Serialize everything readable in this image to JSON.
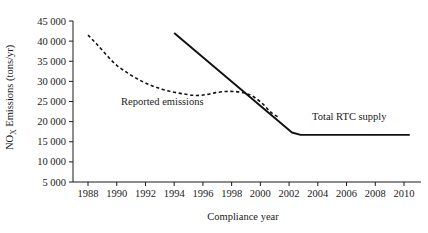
{
  "chart_data": {
    "type": "line",
    "title": "",
    "xlabel": "Compliance year",
    "ylabel": "NOₓ Emissions (tons/yr)",
    "ylabel_main": "NO",
    "ylabel_sub": "X",
    "ylabel_rest": " Emissions (tons/yr)",
    "xlim": [
      1988,
      2010
    ],
    "ylim": [
      5000,
      45000
    ],
    "grid": false,
    "legend_position": "inline-annotations",
    "xticks": [
      1988,
      1990,
      1992,
      1994,
      1996,
      1998,
      2000,
      2002,
      2004,
      2006,
      2008,
      2010
    ],
    "xtick_labels": [
      "1988",
      "1990",
      "1992",
      "1994",
      "1996",
      "1998",
      "2000",
      "2002",
      "2004",
      "2006",
      "2008",
      "2010"
    ],
    "yticks": [
      5000,
      10000,
      15000,
      20000,
      25000,
      30000,
      35000,
      40000,
      45000
    ],
    "ytick_labels": [
      "5 000",
      "10 000",
      "15 000",
      "20 000",
      "25 000",
      "30 000",
      "35 000",
      "40 000",
      "45 000"
    ],
    "series": [
      {
        "name": "Reported emissions",
        "style": "dashed",
        "color": "#111111",
        "label_x": 1990.3,
        "label_y": 24200,
        "x": [
          1988.0,
          1988.6,
          1989.3,
          1990.0,
          1990.8,
          1991.6,
          1992.4,
          1993.2,
          1994.0,
          1994.8,
          1995.5,
          1996.2,
          1996.9,
          1997.6,
          1998.3,
          1999.0,
          1999.6,
          2000.2,
          2000.7,
          2001.2
        ],
        "values": [
          41500,
          39300,
          36500,
          34000,
          32000,
          30300,
          29000,
          28000,
          27300,
          26800,
          26500,
          26700,
          27200,
          27500,
          27450,
          27000,
          26000,
          24300,
          22400,
          21200
        ]
      },
      {
        "name": "Total RTC supply",
        "style": "solid",
        "color": "#111111",
        "label_x": 2003.6,
        "label_y": 20300,
        "x": [
          1994.0,
          2002.2,
          2002.8,
          2010.4
        ],
        "values": [
          42000,
          17300,
          16700,
          16700
        ]
      }
    ],
    "annotations": [
      {
        "text": "Reported emissions",
        "x": 1990.3,
        "y": 24200
      },
      {
        "text": "Total RTC supply",
        "x": 2003.6,
        "y": 20300
      }
    ]
  },
  "axes": {
    "x_title": "Compliance year",
    "y_title_main": "NO",
    "y_title_sub": "X",
    "y_title_rest": " Emissions (tons/yr)"
  }
}
